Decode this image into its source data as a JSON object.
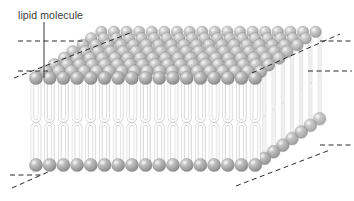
{
  "figure": {
    "background_color": "#ffffff"
  },
  "annotations": [
    {
      "id": "lipid-molecule",
      "text": "lipid molecule",
      "text_x": 18,
      "text_y": 19,
      "leader_x": 44,
      "leader_y_start": 22,
      "leader_y_end": 78,
      "color": "#3c3c3c"
    }
  ],
  "colors": {
    "head_fill": "#a6a6a6",
    "head_fill_light": "#d8d8d8",
    "head_fill_dark": "#8a8a8a",
    "head_stroke": "#8f8f8f",
    "tail_fill": "#f2f2f2",
    "tail_fill_shadow": "#c9c9c9",
    "tail_stroke": "#b0b0b0",
    "dash_line": "#2b2b2b",
    "leader_line": "#4a4a4a",
    "top_face_head": "#b3b3b3"
  },
  "structure": {
    "type": "phospholipid-bilayer",
    "front_face": {
      "column_count": 17,
      "x_start": 36,
      "x_step": 13.7,
      "head_radius": 6.6,
      "top_head_cy": 78,
      "bottom_head_cy": 165,
      "top_tail_top": 78,
      "top_tail_bottom": 121,
      "bottom_tail_top": 124,
      "bottom_tail_bottom": 160
    },
    "top_face": {
      "rows": 7,
      "cols": 18,
      "dx_col": 12.6,
      "dx_row": 9.2,
      "dy_row": -6.6
    },
    "right_face": {
      "depth_rows": 7,
      "dx": 9.2,
      "dy": -6.6
    }
  },
  "dashed_lines": [
    {
      "id": "top-left-horizontal",
      "x1": 18,
      "y1": 41,
      "x2": 86,
      "y2": 41
    },
    {
      "id": "mid-left-horizontal",
      "x1": 18,
      "y1": 71,
      "x2": 48,
      "y2": 71
    },
    {
      "id": "upper-left-diagonal",
      "x1": 14,
      "y1": 78,
      "x2": 130,
      "y2": 33
    },
    {
      "id": "top-right-diagonal",
      "x1": 252,
      "y1": 73,
      "x2": 340,
      "y2": 34
    },
    {
      "id": "upper-right-horizontal",
      "x1": 320,
      "y1": 41,
      "x2": 352,
      "y2": 41
    },
    {
      "id": "right-horizontal",
      "x1": 308,
      "y1": 71,
      "x2": 352,
      "y2": 71
    },
    {
      "id": "lower-right-horizontal",
      "x1": 320,
      "y1": 145,
      "x2": 352,
      "y2": 145
    },
    {
      "id": "bottom-left-horizontal",
      "x1": 10,
      "y1": 175,
      "x2": 42,
      "y2": 175
    },
    {
      "id": "bottom-left-diagonal",
      "x1": 12,
      "y1": 188,
      "x2": 48,
      "y2": 172
    },
    {
      "id": "bottom-right-diagonal",
      "x1": 236,
      "y1": 186,
      "x2": 330,
      "y2": 150
    }
  ]
}
